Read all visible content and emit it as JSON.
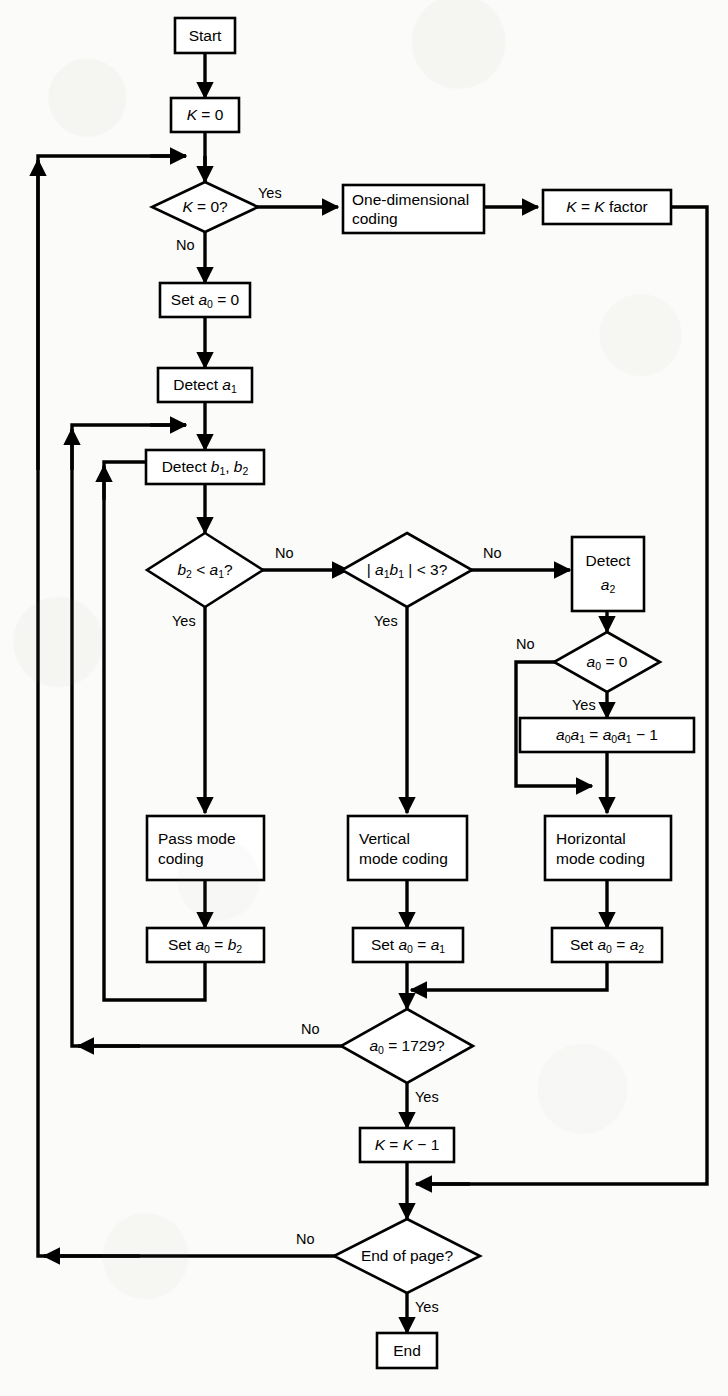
{
  "diagram": {
    "type": "flowchart",
    "background_color": "#fbfbf9",
    "line_color": "#000000",
    "node_fill": "#ffffff",
    "nodes": [
      {
        "id": "start",
        "shape": "rect",
        "label": "Start"
      },
      {
        "id": "k0set",
        "shape": "rect",
        "label": "K = 0"
      },
      {
        "id": "kzero",
        "shape": "diamond",
        "label": "K = 0?"
      },
      {
        "id": "onedim",
        "shape": "rect",
        "label_line1": "One-dimensional",
        "label_line2": "coding"
      },
      {
        "id": "kfactor",
        "shape": "rect",
        "label": "K = K factor"
      },
      {
        "id": "seta0",
        "shape": "rect",
        "label": "Set a0 = 0"
      },
      {
        "id": "deta1",
        "shape": "rect",
        "label": "Detect a1"
      },
      {
        "id": "detb1b2",
        "shape": "rect",
        "label": "Detect b1, b2"
      },
      {
        "id": "b2lta1",
        "shape": "diamond",
        "label": "b2 < a1?"
      },
      {
        "id": "a1b1lt3",
        "shape": "diamond",
        "label": "| a1 b1 | < 3?"
      },
      {
        "id": "deta2",
        "shape": "rect",
        "label_line1": "Detect",
        "label_line2": "a2"
      },
      {
        "id": "a0eq0",
        "shape": "diamond",
        "label": "a0 = 0"
      },
      {
        "id": "a0a1dec",
        "shape": "rect",
        "label": "a0a1 = a0a1 - 1"
      },
      {
        "id": "passmode",
        "shape": "rect",
        "label_line1": "Pass mode",
        "label_line2": "coding"
      },
      {
        "id": "vertmode",
        "shape": "rect",
        "label_line1": "Vertical",
        "label_line2": "mode coding"
      },
      {
        "id": "horizmode",
        "shape": "rect",
        "label_line1": "Horizontal",
        "label_line2": "mode coding"
      },
      {
        "id": "seta0b2",
        "shape": "rect",
        "label": "Set a0 = b2"
      },
      {
        "id": "seta0a1",
        "shape": "rect",
        "label": "Set a0 = a1"
      },
      {
        "id": "seta0a2",
        "shape": "rect",
        "label": "Set a0 = a2"
      },
      {
        "id": "a01729",
        "shape": "diamond",
        "label": "a0 = 1729?"
      },
      {
        "id": "kminus1",
        "shape": "rect",
        "label": "K = K - 1"
      },
      {
        "id": "endpage",
        "shape": "diamond",
        "label": "End of page?"
      },
      {
        "id": "end",
        "shape": "rect",
        "label": "End"
      }
    ],
    "edge_labels": {
      "kzero_yes": "Yes",
      "kzero_no": "No",
      "b2lta1_no": "No",
      "b2lta1_yes": "Yes",
      "a1b1lt3_no": "No",
      "a1b1lt3_yes": "Yes",
      "a0eq0_no": "No",
      "a0eq0_yes": "Yes",
      "a01729_no": "No",
      "a01729_yes": "Yes",
      "endpage_no": "No",
      "endpage_yes": "Yes"
    }
  }
}
